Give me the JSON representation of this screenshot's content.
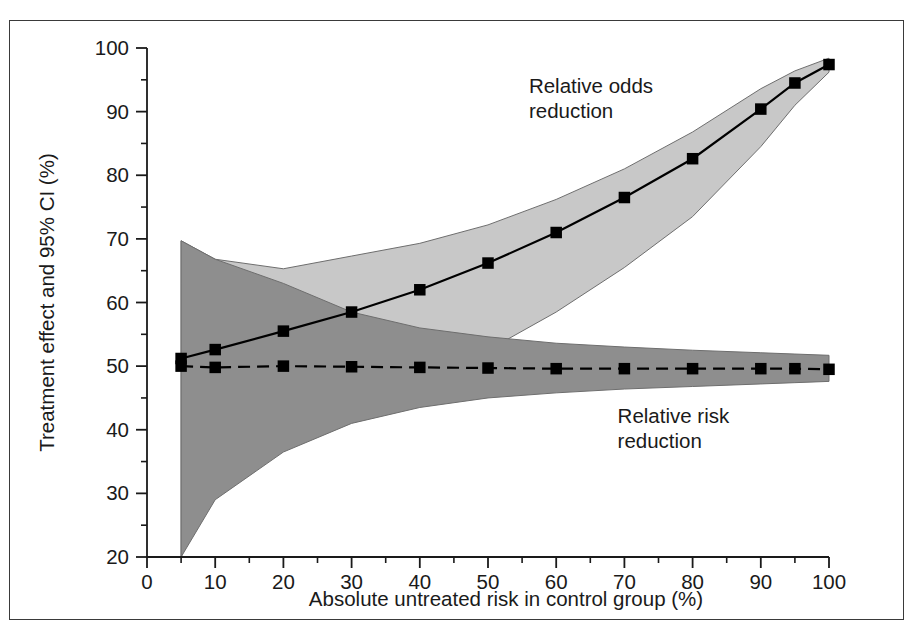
{
  "figure": {
    "border_color": "#3a3a3a",
    "background": "#ffffff"
  },
  "chart_data": {
    "type": "line",
    "title": "",
    "subtitle": "",
    "xlabel": "Absolute untreated risk in control group (%)",
    "ylabel": "Treatment effect and 95% CI (%)",
    "xlim": [
      0,
      100
    ],
    "ylim": [
      20,
      100
    ],
    "xticks": [
      0,
      10,
      20,
      30,
      40,
      50,
      60,
      70,
      80,
      90,
      100
    ],
    "xtick_labels": [
      "0",
      "10",
      "20",
      "30",
      "40",
      "50",
      "60",
      "70",
      "80",
      "90",
      "100"
    ],
    "xminor_ticks": [
      5,
      15,
      25,
      35,
      45,
      55,
      65,
      75,
      85,
      95
    ],
    "yticks": [
      20,
      30,
      40,
      50,
      60,
      70,
      80,
      90,
      100
    ],
    "ytick_labels": [
      "20",
      "30",
      "40",
      "50",
      "60",
      "70",
      "80",
      "90",
      "100"
    ],
    "yminor_ticks": [
      25,
      35,
      45,
      55,
      65,
      75,
      85,
      95
    ],
    "grid": false,
    "legend_position": "inline-annotation",
    "annotations": [
      {
        "name": "relative-odds-reduction",
        "lines": [
          "Relative odds",
          "reduction"
        ],
        "x": 56,
        "y": 93
      },
      {
        "name": "relative-risk-reduction",
        "lines": [
          "Relative risk",
          "reduction"
        ],
        "x": 69,
        "y": 41
      }
    ],
    "x": [
      5,
      10,
      20,
      30,
      40,
      50,
      60,
      70,
      80,
      90,
      95,
      100
    ],
    "series": [
      {
        "name": "Relative odds reduction",
        "line_style": "solid",
        "marker": "square",
        "color": "#000000",
        "values": [
          51.2,
          52.6,
          55.5,
          58.5,
          62.0,
          66.2,
          71.0,
          76.5,
          82.6,
          90.4,
          94.5,
          97.4
        ],
        "ci_band_color": "#c8c8c8",
        "ci_lower": [
          20.0,
          33.0,
          38.0,
          42.5,
          47.5,
          52.5,
          58.5,
          65.5,
          73.5,
          84.5,
          91.0,
          96.2
        ],
        "ci_upper": [
          69.7,
          66.8,
          65.3,
          67.3,
          69.3,
          72.2,
          76.2,
          81.0,
          86.8,
          93.6,
          96.4,
          98.4
        ]
      },
      {
        "name": "Relative risk reduction",
        "line_style": "dashed",
        "marker": "square",
        "color": "#000000",
        "values": [
          50.0,
          49.8,
          50.0,
          49.9,
          49.8,
          49.7,
          49.6,
          49.6,
          49.6,
          49.6,
          49.6,
          49.5
        ],
        "ci_band_color": "#8e8e8e",
        "ci_lower": [
          20.0,
          29.0,
          36.5,
          41.0,
          43.5,
          45.0,
          45.8,
          46.4,
          46.8,
          47.2,
          47.4,
          47.6
        ],
        "ci_upper": [
          69.7,
          66.8,
          63.0,
          58.5,
          56.0,
          54.6,
          53.6,
          53.0,
          52.5,
          52.1,
          51.9,
          51.7
        ]
      }
    ]
  }
}
